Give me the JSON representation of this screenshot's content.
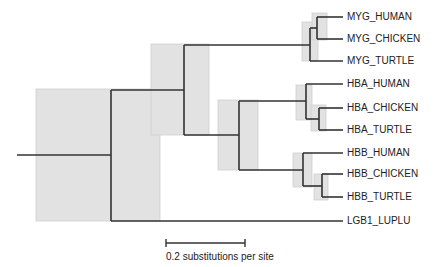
{
  "diagram": {
    "type": "phylogenetic-tree",
    "colors": {
      "branch": "#333333",
      "ci_box": "#e2e2e2",
      "ci_box_border": "#c8c8c8",
      "text": "#222222"
    },
    "taxa": [
      {
        "label": "MYG_HUMAN",
        "y": 17
      },
      {
        "label": "MYG_CHICKEN",
        "y": 39
      },
      {
        "label": "MYG_TURTLE",
        "y": 61
      },
      {
        "label": "HBA_HUMAN",
        "y": 84
      },
      {
        "label": "HBA_CHICKEN",
        "y": 108
      },
      {
        "label": "HBA_TURTLE",
        "y": 130
      },
      {
        "label": "HBB_HUMAN",
        "y": 153
      },
      {
        "label": "HBB_CHICKEN",
        "y": 174
      },
      {
        "label": "HBB_TURTLE",
        "y": 197
      },
      {
        "label": "LGB1_LUPLU",
        "y": 221
      }
    ],
    "scale_bar": {
      "label": "0.2 substitutions per site",
      "value": 0.2
    }
  }
}
